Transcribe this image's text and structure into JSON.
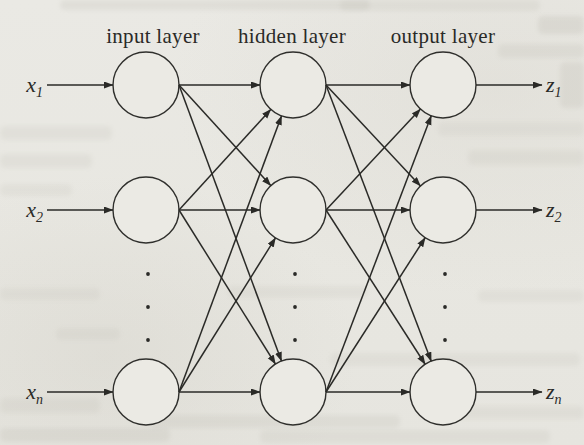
{
  "figure": {
    "colors": {
      "background": "#e9e8e3",
      "ink": "#2a2a27",
      "node_fill": "#ebeae4",
      "node_stroke": "#2f2f2c",
      "ghost": "#aaa79c"
    },
    "diagram": {
      "node_radius": 33,
      "rows": [
        85,
        210,
        392
      ],
      "dot_rows": [
        274,
        307,
        340
      ],
      "dot_radius": 1.9,
      "label_baseline_y": 43,
      "layers": [
        {
          "id": "input",
          "label": "input layer",
          "cx": 146,
          "label_cx": 153
        },
        {
          "id": "hidden",
          "label": "hidden layer",
          "cx": 293,
          "label_cx": 292
        },
        {
          "id": "output",
          "label": "output layer",
          "cx": 443,
          "label_cx": 443
        }
      ],
      "inputs": [
        {
          "base": "x",
          "sub": "1",
          "row": 0
        },
        {
          "base": "x",
          "sub": "2",
          "row": 1
        },
        {
          "base": "x",
          "sub": "n",
          "row": 2
        }
      ],
      "outputs": [
        {
          "base": "z",
          "sub": "1",
          "row": 0
        },
        {
          "base": "z",
          "sub": "2",
          "row": 1
        },
        {
          "base": "z",
          "sub": "n",
          "row": 2
        }
      ],
      "connections": [
        {
          "from": [
            0,
            0
          ],
          "to": [
            1,
            0
          ]
        },
        {
          "from": [
            0,
            0
          ],
          "to": [
            1,
            1
          ]
        },
        {
          "from": [
            0,
            0
          ],
          "to": [
            1,
            2
          ]
        },
        {
          "from": [
            0,
            1
          ],
          "to": [
            1,
            0
          ]
        },
        {
          "from": [
            0,
            1
          ],
          "to": [
            1,
            1
          ]
        },
        {
          "from": [
            0,
            1
          ],
          "to": [
            1,
            2
          ]
        },
        {
          "from": [
            0,
            2
          ],
          "to": [
            1,
            0
          ]
        },
        {
          "from": [
            0,
            2
          ],
          "to": [
            1,
            1
          ]
        },
        {
          "from": [
            0,
            2
          ],
          "to": [
            1,
            2
          ]
        },
        {
          "from": [
            1,
            0
          ],
          "to": [
            2,
            0
          ]
        },
        {
          "from": [
            1,
            0
          ],
          "to": [
            2,
            1
          ]
        },
        {
          "from": [
            1,
            0
          ],
          "to": [
            2,
            2
          ]
        },
        {
          "from": [
            1,
            1
          ],
          "to": [
            2,
            0
          ]
        },
        {
          "from": [
            1,
            1
          ],
          "to": [
            2,
            1
          ]
        },
        {
          "from": [
            1,
            1
          ],
          "to": [
            2,
            2
          ]
        },
        {
          "from": [
            1,
            2
          ],
          "to": [
            2,
            0
          ]
        },
        {
          "from": [
            1,
            2
          ],
          "to": [
            2,
            1
          ]
        },
        {
          "from": [
            1,
            2
          ],
          "to": [
            2,
            2
          ]
        }
      ]
    }
  }
}
